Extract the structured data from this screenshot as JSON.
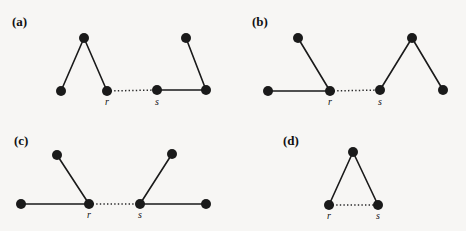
{
  "figure": {
    "width": 466,
    "height": 231,
    "background_color": "#f7f6f4",
    "ink_color": "#1a1a1a",
    "node_radius": 5,
    "panels": [
      {
        "id": "a",
        "label": "(a)",
        "label_x": 12,
        "label_y": 26,
        "nodes": [
          {
            "name": "a-n1",
            "x": 61,
            "y": 91,
            "label": ""
          },
          {
            "name": "a-n2",
            "x": 84,
            "y": 38,
            "label": ""
          },
          {
            "name": "a-r",
            "x": 107,
            "y": 91,
            "label": "r",
            "label_x": 107,
            "label_y": 105
          },
          {
            "name": "a-s",
            "x": 157,
            "y": 90,
            "label": "s",
            "label_x": 157,
            "label_y": 105
          },
          {
            "name": "a-n5",
            "x": 206,
            "y": 90,
            "label": ""
          },
          {
            "name": "a-n6",
            "x": 186,
            "y": 38,
            "label": ""
          }
        ],
        "edges": [
          {
            "from": "a-n1",
            "to": "a-n2",
            "style": "solid"
          },
          {
            "from": "a-n2",
            "to": "a-r",
            "style": "solid"
          },
          {
            "from": "a-r",
            "to": "a-s",
            "style": "dotted"
          },
          {
            "from": "a-s",
            "to": "a-n5",
            "style": "solid"
          },
          {
            "from": "a-n5",
            "to": "a-n6",
            "style": "solid"
          }
        ]
      },
      {
        "id": "b",
        "label": "(b)",
        "label_x": 252,
        "label_y": 26,
        "nodes": [
          {
            "name": "b-n1",
            "x": 268,
            "y": 91,
            "label": ""
          },
          {
            "name": "b-n2",
            "x": 298,
            "y": 38,
            "label": ""
          },
          {
            "name": "b-r",
            "x": 330,
            "y": 91,
            "label": "r",
            "label_x": 330,
            "label_y": 105
          },
          {
            "name": "b-s",
            "x": 380,
            "y": 90,
            "label": "s",
            "label_x": 380,
            "label_y": 105
          },
          {
            "name": "b-n5",
            "x": 412,
            "y": 38,
            "label": ""
          },
          {
            "name": "b-n6",
            "x": 443,
            "y": 90,
            "label": ""
          }
        ],
        "edges": [
          {
            "from": "b-n1",
            "to": "b-r",
            "style": "solid"
          },
          {
            "from": "b-n2",
            "to": "b-r",
            "style": "solid"
          },
          {
            "from": "b-r",
            "to": "b-s",
            "style": "dotted"
          },
          {
            "from": "b-s",
            "to": "b-n5",
            "style": "solid"
          },
          {
            "from": "b-n5",
            "to": "b-n6",
            "style": "solid"
          }
        ]
      },
      {
        "id": "c",
        "label": "(c)",
        "label_x": 14,
        "label_y": 145,
        "nodes": [
          {
            "name": "c-n1",
            "x": 21,
            "y": 204,
            "label": ""
          },
          {
            "name": "c-n2",
            "x": 57,
            "y": 155,
            "label": ""
          },
          {
            "name": "c-r",
            "x": 89,
            "y": 204,
            "label": "r",
            "label_x": 89,
            "label_y": 218
          },
          {
            "name": "c-s",
            "x": 140,
            "y": 204,
            "label": "s",
            "label_x": 140,
            "label_y": 218
          },
          {
            "name": "c-n5",
            "x": 172,
            "y": 154,
            "label": ""
          },
          {
            "name": "c-n6",
            "x": 206,
            "y": 204,
            "label": ""
          }
        ],
        "edges": [
          {
            "from": "c-n1",
            "to": "c-r",
            "style": "solid"
          },
          {
            "from": "c-n2",
            "to": "c-r",
            "style": "solid"
          },
          {
            "from": "c-r",
            "to": "c-s",
            "style": "dotted"
          },
          {
            "from": "c-s",
            "to": "c-n5",
            "style": "solid"
          },
          {
            "from": "c-s",
            "to": "c-n6",
            "style": "solid"
          }
        ]
      },
      {
        "id": "d",
        "label": "(d)",
        "label_x": 283,
        "label_y": 145,
        "nodes": [
          {
            "name": "d-top",
            "x": 353,
            "y": 152,
            "label": ""
          },
          {
            "name": "d-r",
            "x": 329,
            "y": 205,
            "label": "r",
            "label_x": 329,
            "label_y": 219
          },
          {
            "name": "d-s",
            "x": 378,
            "y": 205,
            "label": "s",
            "label_x": 378,
            "label_y": 219
          }
        ],
        "edges": [
          {
            "from": "d-r",
            "to": "d-top",
            "style": "solid"
          },
          {
            "from": "d-top",
            "to": "d-s",
            "style": "solid"
          },
          {
            "from": "d-r",
            "to": "d-s",
            "style": "dotted"
          }
        ]
      }
    ]
  }
}
